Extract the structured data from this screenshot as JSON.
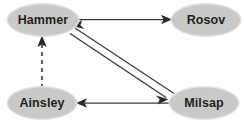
{
  "diagram": {
    "background_color": "#ffffff",
    "node_fill_color": "#c9c9c9",
    "node_text_color": "#231f20",
    "edge_color": "#3a3a3a",
    "nodes": [
      {
        "id": "hammer",
        "label": "Hammer",
        "cx": 43,
        "cy": 20,
        "rx": 35,
        "ry": 15.5
      },
      {
        "id": "rosov",
        "label": "Rosov",
        "cx": 206,
        "cy": 20,
        "rx": 34,
        "ry": 15.5
      },
      {
        "id": "ainsley",
        "label": "Ainsley",
        "cx": 42,
        "cy": 103,
        "rx": 34,
        "ry": 15.5
      },
      {
        "id": "milsap",
        "label": "Milsap",
        "cx": 204,
        "cy": 103,
        "rx": 34,
        "ry": 15.5
      }
    ],
    "edges": [
      {
        "id": "hammer-to-rosov",
        "from": "Hammer",
        "to": "Rosov",
        "style": "solid",
        "direction": "forward"
      },
      {
        "id": "hammer-to-milsap",
        "from": "Hammer",
        "to": "Milsap",
        "style": "solid",
        "direction": "forward"
      },
      {
        "id": "milsap-to-hammer",
        "from": "Milsap",
        "to": "Hammer",
        "style": "solid",
        "direction": "forward"
      },
      {
        "id": "milsap-to-ainsley",
        "from": "Milsap",
        "to": "Ainsley",
        "style": "solid",
        "direction": "forward"
      },
      {
        "id": "ainsley-to-hammer",
        "from": "Ainsley",
        "to": "Hammer",
        "style": "dashed",
        "direction": "forward"
      }
    ]
  }
}
